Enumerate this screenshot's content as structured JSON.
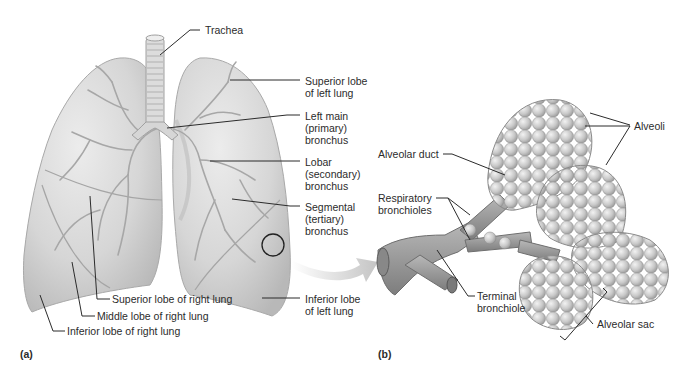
{
  "figure": {
    "panels": [
      {
        "id": "a",
        "label": "(a)"
      },
      {
        "id": "b",
        "label": "(b)"
      }
    ],
    "panel_a": {
      "labels": {
        "trachea": "Trachea",
        "superior_lobe_left": "Superior lobe\nof left lung",
        "left_main_bronchus": "Left main\n(primary)\nbronchus",
        "lobar_bronchus": "Lobar\n(secondary)\nbronchus",
        "segmental_bronchus": "Segmental\n(tertiary)\nbronchus",
        "inferior_lobe_left": "Inferior lobe\nof left lung",
        "superior_lobe_right": "Superior lobe of right lung",
        "middle_lobe_right": "Middle lobe of right lung",
        "inferior_lobe_right": "Inferior lobe of right lung"
      }
    },
    "panel_b": {
      "labels": {
        "alveoli": "Alveoli",
        "alveolar_duct": "Alveolar duct",
        "respiratory_bronchioles": "Respiratory\nbronchioles",
        "terminal_bronchiole": "Terminal\nbronchiole",
        "alveolar_sac": "Alveolar sac"
      }
    },
    "colors": {
      "lung_fill": "#d9d9d9",
      "lung_shadow": "#bdbdbd",
      "airway": "#a8a8a8",
      "alveoli_fill": "#c4c4c4",
      "leader_line": "#2b2b2b",
      "arrow": "#cfcfcf"
    }
  }
}
